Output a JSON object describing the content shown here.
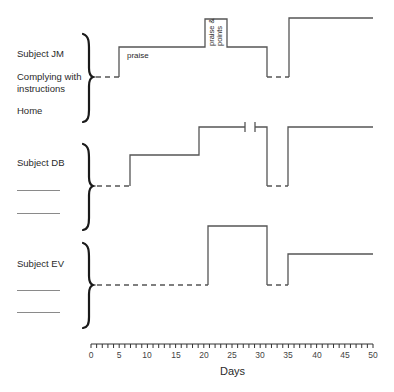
{
  "chart_data": {
    "type": "line",
    "subtype": "multiple-baseline step chart",
    "xlabel": "Days",
    "xlim": [
      0,
      50
    ],
    "x_ticks": [
      0,
      5,
      10,
      15,
      20,
      25,
      30,
      35,
      40,
      45,
      50
    ],
    "minor_tick_interval": 1,
    "grid": false,
    "legend": null,
    "y_levels": [
      "baseline",
      "intervention",
      "high"
    ],
    "series": [
      {
        "name": "Subject JM",
        "row_labels": [
          "Subject JM",
          "Complying with instructions",
          "Home"
        ],
        "segments": [
          {
            "from": 0,
            "to": 5,
            "level": "baseline",
            "style": "dashed"
          },
          {
            "from": 5,
            "to": 20,
            "level": "mid",
            "style": "solid",
            "annotation": "praise"
          },
          {
            "from": 20,
            "to": 24,
            "level": "high",
            "style": "solid",
            "annotation": "praise & points"
          },
          {
            "from": 24,
            "to": 31,
            "level": "mid",
            "style": "solid"
          },
          {
            "from": 31,
            "to": 35,
            "level": "baseline",
            "style": "dashed"
          },
          {
            "from": 35,
            "to": 50,
            "level": "high",
            "style": "solid"
          }
        ]
      },
      {
        "name": "Subject DB",
        "row_labels": [
          "Subject DB",
          "",
          ""
        ],
        "segments": [
          {
            "from": 0,
            "to": 7,
            "level": "baseline",
            "style": "dashed"
          },
          {
            "from": 7,
            "to": 19,
            "level": "mid",
            "style": "solid"
          },
          {
            "from": 19,
            "to": 31,
            "level": "high",
            "style": "solid",
            "break_between": [
              27,
              29
            ]
          },
          {
            "from": 31,
            "to": 35,
            "level": "baseline",
            "style": "dashed"
          },
          {
            "from": 35,
            "to": 50,
            "level": "high",
            "style": "solid"
          }
        ]
      },
      {
        "name": "Subject EV",
        "row_labels": [
          "Subject EV",
          "",
          ""
        ],
        "segments": [
          {
            "from": 0,
            "to": 21,
            "level": "baseline",
            "style": "dashed"
          },
          {
            "from": 21,
            "to": 31,
            "level": "high",
            "style": "solid"
          },
          {
            "from": 31,
            "to": 35,
            "level": "baseline",
            "style": "dashed"
          },
          {
            "from": 35,
            "to": 50,
            "level": "mid",
            "style": "solid"
          }
        ]
      }
    ],
    "annotations": [
      "praise",
      "praise & points"
    ]
  },
  "labels": {
    "jm": {
      "subject": "Subject JM",
      "behavior": "Complying with",
      "behavior2": "instructions",
      "setting": "Home"
    },
    "db": {
      "subject": "Subject DB"
    },
    "ev": {
      "subject": "Subject EV"
    },
    "annot_praise": "praise",
    "annot_praise_points_1": "praise &",
    "annot_praise_points_2": "points"
  },
  "axis": {
    "title": "Days",
    "ticks": [
      "0",
      "5",
      "10",
      "15",
      "20",
      "25",
      "30",
      "35",
      "40",
      "45",
      "50"
    ]
  },
  "colors": {
    "line": "#555555",
    "text": "#2a2a2a",
    "brace": "#1a1a1a"
  }
}
